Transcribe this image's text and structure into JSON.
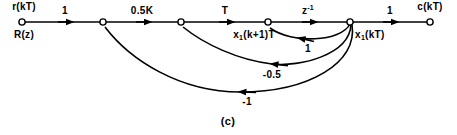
{
  "figure": {
    "caption": "(c)",
    "type": "signal-flow-graph"
  },
  "nodes": [
    {
      "id": "r",
      "label_above": "r(kT)",
      "label_below": "R(z)",
      "x": 22,
      "y": 22
    },
    {
      "id": "n2",
      "label_above": "",
      "label_below": "",
      "x": 103,
      "y": 22
    },
    {
      "id": "n3",
      "label_above": "",
      "label_below": "",
      "x": 181,
      "y": 22
    },
    {
      "id": "n4",
      "label_above": "",
      "label_below": "x1(k+1)T",
      "x": 268,
      "y": 22
    },
    {
      "id": "n5",
      "label_above": "",
      "label_below": "x1(kT)",
      "x": 350,
      "y": 22
    },
    {
      "id": "c",
      "label_above": "c(kT)",
      "label_below": "",
      "x": 430,
      "y": 22
    }
  ],
  "node_labels": {
    "input_above": "r(kT)",
    "input_below": "R(z)",
    "state_next_base": "x",
    "state_next_sub": "1",
    "state_next_rest": "(k+1)T",
    "state_base": "x",
    "state_sub": "1",
    "state_rest": "(kT)",
    "output": "c(kT)"
  },
  "forward_branches": [
    {
      "from": "r",
      "to": "n2",
      "gain": "1",
      "label_x": 65,
      "label_y": 8
    },
    {
      "from": "n2",
      "to": "n3",
      "gain": "0.5K",
      "label_x": 142,
      "label_y": 8
    },
    {
      "from": "n3",
      "to": "n4",
      "gain": "T",
      "label_x": 225,
      "label_y": 8
    },
    {
      "from": "n4",
      "to": "n5",
      "gain_base": "z",
      "gain_sup": "-1",
      "label_x": 308,
      "label_y": 8
    },
    {
      "from": "n5",
      "to": "c",
      "gain": "1",
      "label_x": 390,
      "label_y": 8
    }
  ],
  "feedback_branches": [
    {
      "from": "n5",
      "to": "n4",
      "gain": "1",
      "label_x": 308,
      "label_y": 46
    },
    {
      "from": "n5",
      "to": "n3",
      "gain": "-0.5",
      "label_x": 272,
      "label_y": 68
    },
    {
      "from": "n5",
      "to": "n2",
      "gain": "-1",
      "label_x": 247,
      "label_y": 97
    }
  ],
  "style": {
    "line_color": "#000000",
    "background": "#ffffff",
    "node_fill": "#ffffff"
  }
}
